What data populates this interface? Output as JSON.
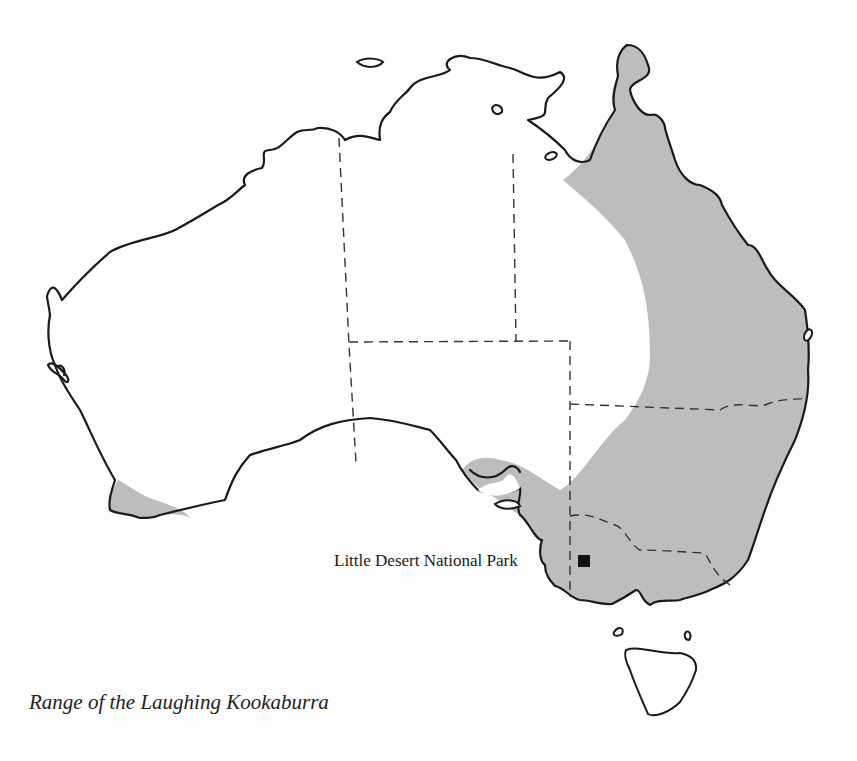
{
  "map": {
    "title": "Range of the Laughing Kookaburra",
    "subject": "Australia",
    "legend": {
      "shaded_area": "range of the Laughing Kookaburra"
    },
    "markers": [
      {
        "label": "Little Desert National Park",
        "symbol": "filled-square"
      }
    ],
    "colors": {
      "range_fill": "#bdbdbd",
      "coastline": "#1a1a1a",
      "background": "#ffffff",
      "marker": "#111111"
    }
  }
}
